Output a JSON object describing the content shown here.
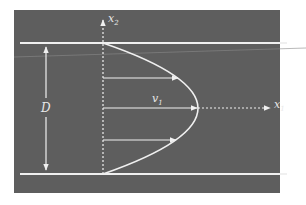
{
  "diagram": {
    "labels": {
      "x2_axis": "x",
      "x2_sub": "2",
      "x1_axis": "x",
      "x1_sub": "1",
      "velocity": "v",
      "velocity_sub": "1",
      "diameter": "D"
    },
    "colors": {
      "background": "#5e5e5e",
      "lines": "#f0f0f0",
      "page": "#ffffff"
    },
    "elements": [
      "top wall",
      "bottom wall",
      "vertical dashed x2 axis",
      "horizontal dashed x1 axis",
      "parabolic velocity profile",
      "velocity arrows (3)",
      "double-headed D dimension arrow"
    ]
  }
}
